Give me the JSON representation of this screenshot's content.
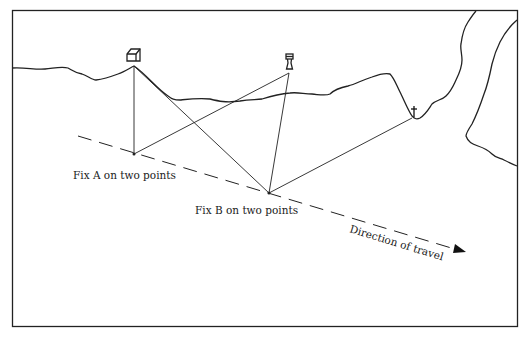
{
  "diagram": {
    "labels": {
      "fix_a": "Fix A on two points",
      "fix_b": "Fix B on two points",
      "direction": "Direction of travel"
    },
    "landmarks": [
      {
        "name": "house",
        "icon": "house-icon",
        "x": 134,
        "y": 62
      },
      {
        "name": "lighthouse",
        "icon": "lighthouse-icon",
        "x": 289,
        "y": 68
      },
      {
        "name": "church",
        "icon": "cross-icon",
        "x": 414,
        "y": 117
      }
    ],
    "fixes": [
      {
        "name": "Fix A",
        "x": 134,
        "y": 154
      },
      {
        "name": "Fix B",
        "x": 269,
        "y": 193
      }
    ],
    "colors": {
      "line": "#222222",
      "background": "#ffffff"
    }
  }
}
